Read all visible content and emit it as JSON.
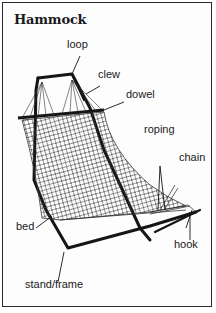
{
  "diagram": {
    "title": "Hammock",
    "labels": {
      "loop": "loop",
      "clew": "clew",
      "dowel": "dowel",
      "roping": "roping",
      "chain": "chain",
      "bed": "bed",
      "hook": "hook",
      "stand_frame": "stand/frame"
    }
  }
}
